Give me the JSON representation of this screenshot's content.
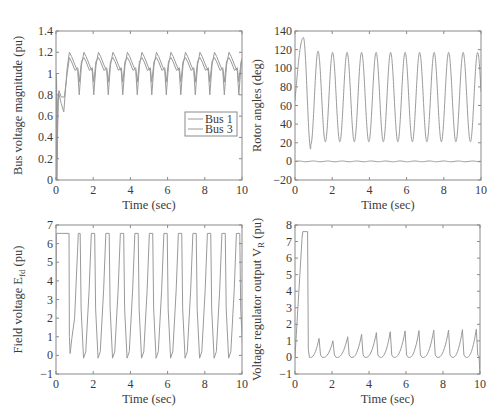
{
  "chart_data": [
    {
      "id": "bus-voltage",
      "type": "line",
      "title": "",
      "xlabel": "Time (sec)",
      "ylabel": "Bus voltage magnitude (pu)",
      "xlim": [
        0,
        10
      ],
      "ylim": [
        0,
        1.4
      ],
      "xticks": [
        0,
        2,
        4,
        6,
        8,
        10
      ],
      "yticks": [
        0,
        0.2,
        0.4,
        0.6,
        0.8,
        1,
        1.2,
        1.4
      ],
      "ytick_labels": [
        "0",
        "0.2",
        "0.4",
        "0.6",
        "0.8",
        "1",
        "1.2",
        "1.4"
      ],
      "grid": false,
      "legend": {
        "position": "center-right",
        "entries": [
          "Bus 1",
          "Bus 3"
        ]
      },
      "series": [
        {
          "name": "Bus 1",
          "description": "periodic oscillation ~1.3 s period",
          "x": [
            0,
            0.05,
            0.1,
            0.2,
            0.4,
            0.7,
            1.0,
            1.25,
            1.5,
            1.8,
            2.05
          ],
          "values": [
            1.0,
            0.1,
            0.8,
            0.85,
            0.76,
            1.15,
            1.08,
            0.95,
            1.15,
            1.08,
            0.92
          ],
          "peak": 1.15,
          "trough": 0.92
        },
        {
          "name": "Bus 3",
          "description": "periodic oscillation, larger amplitude",
          "x": [
            0,
            0.05,
            0.1,
            0.2,
            0.45,
            0.7,
            1.0,
            1.25,
            1.5,
            1.8,
            2.05
          ],
          "values": [
            1.0,
            0.0,
            0.4,
            0.82,
            0.64,
            1.2,
            1.1,
            0.82,
            1.2,
            1.1,
            0.8
          ],
          "peak": 1.2,
          "trough": 0.8
        }
      ],
      "period_sec": 0.78
    },
    {
      "id": "rotor-angles",
      "type": "line",
      "xlabel": "Time (sec)",
      "ylabel": "Rotor angles (deg)",
      "xlim": [
        0,
        10
      ],
      "ylim": [
        -20,
        140
      ],
      "xticks": [
        0,
        2,
        4,
        6,
        8,
        10
      ],
      "yticks": [
        -20,
        0,
        20,
        40,
        60,
        80,
        100,
        120,
        140
      ],
      "ytick_labels": [
        "−20",
        "0",
        "20",
        "40",
        "60",
        "80",
        "100",
        "120",
        "140"
      ],
      "grid": false,
      "series": [
        {
          "name": "Generator angle",
          "first_peak": {
            "x": 0.45,
            "y": 133
          },
          "first_trough": {
            "x": 0.85,
            "y": 13
          },
          "peak": 117,
          "trough": 21,
          "start": 65,
          "period_sec": 0.78
        },
        {
          "name": "Reference angle",
          "values_approx": 0,
          "ripple": 0.5
        }
      ]
    },
    {
      "id": "field-voltage",
      "type": "line",
      "xlabel": "Time (sec)",
      "ylabel": "Field voltage E",
      "ylabel_sub": "fd",
      "ylabel_suffix": " (pu)",
      "xlim": [
        0,
        10
      ],
      "ylim": [
        -1,
        7
      ],
      "xticks": [
        0,
        2,
        4,
        6,
        8,
        10
      ],
      "yticks": [
        -1,
        0,
        1,
        2,
        3,
        4,
        5,
        6,
        7
      ],
      "ytick_labels": [
        "−1",
        "0",
        "1",
        "2",
        "3",
        "4",
        "5",
        "6",
        "7"
      ],
      "grid": false,
      "series": [
        {
          "name": "Efd",
          "ceiling": 6.55,
          "floor": -0.15,
          "initial_hold": {
            "x": [
              0,
              0.7
            ],
            "y": 6.55
          },
          "first_drop": {
            "x": 0.75,
            "y": 0.1
          },
          "period_sec": 0.78
        }
      ]
    },
    {
      "id": "regulator-output",
      "type": "line",
      "xlabel": "Time (sec)",
      "ylabel": "Voltage regulator output V",
      "ylabel_sub": "R",
      "ylabel_suffix": " (pu)",
      "xlim": [
        0,
        10
      ],
      "ylim": [
        -1,
        8
      ],
      "xticks": [
        0,
        2,
        4,
        6,
        8,
        10
      ],
      "yticks": [
        -1,
        0,
        1,
        2,
        3,
        4,
        5,
        6,
        7,
        8
      ],
      "ytick_labels": [
        "−1",
        "0",
        "1",
        "2",
        "3",
        "4",
        "5",
        "6",
        "7",
        "8"
      ],
      "grid": false,
      "series": [
        {
          "name": "VR",
          "initial_plateau": {
            "x": [
              0.4,
              0.7
            ],
            "y": 7.6
          },
          "spike_peaks_x": [
            1.3,
            2.05,
            2.85,
            3.6,
            4.4,
            5.15,
            5.95,
            6.7,
            7.5,
            8.3,
            9.05,
            9.8
          ],
          "spike_peaks_y": [
            1.15,
            1.0,
            1.25,
            1.4,
            1.5,
            1.55,
            1.6,
            1.62,
            1.65,
            1.65,
            1.68,
            1.7
          ],
          "floor": 0.0
        }
      ]
    }
  ]
}
